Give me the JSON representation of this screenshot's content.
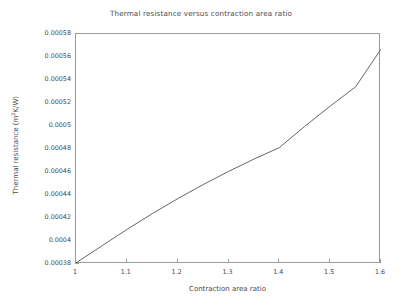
{
  "chart_data": {
    "type": "line",
    "title": "Thermal resistance versus contraction area ratio",
    "xlabel": "Contraction area ratio",
    "ylabel": "Thermal resistance (m²K/W)",
    "ylabel_base": "Thermal resistance (m",
    "ylabel_sup": "2",
    "ylabel_tail": "K/W)",
    "xlim": [
      1,
      1.6
    ],
    "ylim": [
      0.00038,
      0.00058
    ],
    "grid": false,
    "legend": null,
    "line_color": "#555555",
    "xticks": [
      "1",
      "1.1",
      "1.2",
      "1.3",
      "1.4",
      "1.5",
      "1.6"
    ],
    "xtick_values": [
      1,
      1.1,
      1.2,
      1.3,
      1.4,
      1.5,
      1.6
    ],
    "yticks": [
      "0.00038",
      "0.0004",
      "0.00042",
      "0.00044",
      "0.00046",
      "0.00048",
      "0.0005",
      "0.00052",
      "0.00054",
      "0.00056",
      "0.00058"
    ],
    "ytick_values": [
      0.00038,
      0.0004,
      0.00042,
      0.00044,
      0.00046,
      0.00048,
      0.0005,
      0.00052,
      0.00054,
      0.00056,
      0.00058
    ],
    "x": [
      1.0,
      1.05,
      1.1,
      1.15,
      1.2,
      1.25,
      1.3,
      1.35,
      1.4,
      1.45,
      1.5,
      1.55,
      1.6
    ],
    "values": [
      0.000381,
      0.0003955,
      0.00041,
      0.0004238,
      0.0004368,
      0.000449,
      0.0004605,
      0.0004712,
      0.0004812,
      0.0004997,
      0.0005173,
      0.000534,
      0.0005669
    ],
    "series": [
      {
        "name": "Thermal resistance",
        "x": [
          1.0,
          1.05,
          1.1,
          1.15,
          1.2,
          1.25,
          1.3,
          1.35,
          1.4,
          1.45,
          1.5,
          1.55,
          1.6
        ],
        "values": [
          0.000381,
          0.0003955,
          0.00041,
          0.0004238,
          0.0004368,
          0.000449,
          0.0004605,
          0.0004712,
          0.0004812,
          0.0004997,
          0.0005173,
          0.000534,
          0.0005669
        ]
      }
    ]
  },
  "style": {
    "axis_color": "#9a9a9a",
    "text_color": "#4a4a4a",
    "background": "#ffffff"
  }
}
